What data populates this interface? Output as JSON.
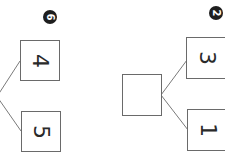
{
  "worksheet": {
    "orientation": "rotated 90deg clockwise",
    "problems": [
      {
        "id": "problem-6",
        "badge": "6",
        "whole": "",
        "parts": [
          "4",
          "5"
        ]
      },
      {
        "id": "problem-2",
        "badge": "2",
        "whole": "",
        "parts": [
          "3",
          "1"
        ]
      }
    ]
  },
  "colors": {
    "box_border": "#6a6a6a",
    "line": "#7a7a7a",
    "badge_bg": "#1e1e1e",
    "text": "#2a2a2a"
  }
}
